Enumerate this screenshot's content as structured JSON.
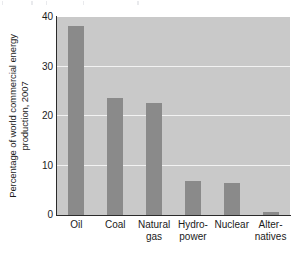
{
  "chart_data": {
    "type": "bar",
    "title": "",
    "xlabel": "",
    "ylabel_line1": "Percentage of world commercial energy",
    "ylabel_line2": "production, 2007",
    "categories": [
      "Oil",
      "Coal",
      "Natural gas",
      "Hydro-power",
      "Nuclear",
      "Alternatives"
    ],
    "category_lines": [
      {
        "line1": "Oil",
        "line2": ""
      },
      {
        "line1": "Coal",
        "line2": ""
      },
      {
        "line1": "Natural",
        "line2": "gas"
      },
      {
        "line1": "Hydro-",
        "line2": "power"
      },
      {
        "line1": "Nuclear",
        "line2": ""
      },
      {
        "line1": "Alter-",
        "line2": "natives"
      }
    ],
    "values": [
      38.2,
      23.6,
      22.7,
      6.9,
      6.5,
      0.6
    ],
    "ylim": [
      0,
      40
    ],
    "yticks": [
      0,
      10,
      20,
      30,
      40
    ],
    "ytick_labels": [
      "0",
      "10",
      "20",
      "30",
      "40"
    ],
    "gridlines": [
      10,
      20,
      30
    ],
    "grid": true,
    "legend": "none",
    "colors": {
      "bar": "#8a8a8a",
      "plot_background": "#c9c9c9",
      "gridline": "#f2f2f2",
      "axis": "#2b2b2b",
      "text": "#1a1a1a",
      "figure_background": "#ffffff"
    }
  }
}
